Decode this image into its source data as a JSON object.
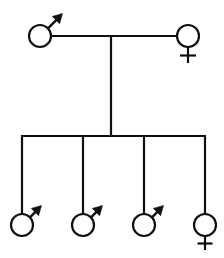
{
  "diagram": {
    "type": "genetics-pedigree",
    "background_color": "#ffffff",
    "stroke_color": "#101010",
    "canvas": {
      "width": 224,
      "height": 258
    },
    "symbol_legend": {
      "male": "circle-with-arrow-upper-right (Mars symbol)",
      "female": "circle-with-cross-below (Venus symbol)"
    },
    "generations": [
      {
        "label": "Generation I",
        "individuals": [
          {
            "id": "I-1",
            "sex": "male",
            "symbol": "mars-symbol",
            "cx": 40,
            "cy": 36,
            "r": 11
          },
          {
            "id": "I-2",
            "sex": "female",
            "symbol": "venus-symbol",
            "cx": 188,
            "cy": 36,
            "r": 11
          }
        ],
        "union": {
          "partners": [
            "I-1",
            "I-2"
          ],
          "line_y": 36,
          "line_x1": 51,
          "line_x2": 177,
          "descent_x": 111,
          "descent_y1": 36,
          "descent_y2": 136
        }
      },
      {
        "label": "Generation II",
        "sibship_bar": {
          "y": 136,
          "x1": 22,
          "x2": 205
        },
        "individuals": [
          {
            "id": "II-1",
            "sex": "male",
            "symbol": "mars-symbol",
            "cx": 22,
            "cy": 225,
            "r": 11,
            "drop_x": 22,
            "drop_y1": 136,
            "drop_y2": 214
          },
          {
            "id": "II-2",
            "sex": "male",
            "symbol": "mars-symbol",
            "cx": 83,
            "cy": 225,
            "r": 11,
            "drop_x": 83,
            "drop_y1": 136,
            "drop_y2": 214
          },
          {
            "id": "II-3",
            "sex": "male",
            "symbol": "mars-symbol",
            "cx": 144,
            "cy": 225,
            "r": 11,
            "drop_x": 144,
            "drop_y1": 136,
            "drop_y2": 214
          },
          {
            "id": "II-4",
            "sex": "female",
            "symbol": "venus-symbol",
            "cx": 205,
            "cy": 225,
            "r": 11,
            "drop_x": 205,
            "drop_y1": 136,
            "drop_y2": 214
          }
        ]
      }
    ],
    "counts": {
      "parents": 2,
      "children": 4,
      "male_total": 4,
      "female_total": 2
    }
  }
}
